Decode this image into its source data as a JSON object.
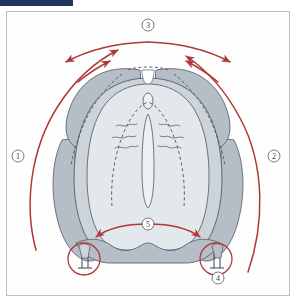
{
  "figure": {
    "title": "",
    "type": "anatomical-diagram",
    "frame": {
      "border_color": "#bdbdbd",
      "background_color": "#fefefe"
    },
    "header_bar": {
      "color": "#23355e",
      "label": ""
    },
    "colors": {
      "arrow_red": "#b03838",
      "outline_gray": "#5d6670",
      "fill_light": "#e3e8ec",
      "fill_mid": "#ccd3d9",
      "fill_dark": "#b5bec6",
      "dashed_line": "#4a535c",
      "frame_border": "#bdbdbd"
    },
    "markers": [
      {
        "id": "marker-1",
        "label": "①",
        "number": "1",
        "x": 18,
        "y": 156,
        "description": "left lateral expansion arc"
      },
      {
        "id": "marker-2",
        "label": "②",
        "number": "2",
        "x": 274,
        "y": 156,
        "description": "right lateral expansion arc"
      },
      {
        "id": "marker-3",
        "label": "③",
        "number": "3",
        "x": 148,
        "y": 25,
        "description": "anterior transverse expansion arc"
      },
      {
        "id": "marker-4",
        "label": "④",
        "number": "4",
        "x": 218,
        "y": 278,
        "description": "posterior tuberosity detail circle"
      },
      {
        "id": "marker-5",
        "label": "⑤",
        "number": "5",
        "x": 148,
        "y": 224,
        "description": "posterior transverse expansion arc"
      }
    ],
    "anatomy_parts": [
      {
        "name": "palatal-vault",
        "fill": "#e3e8ec"
      },
      {
        "name": "alveolar-ridge",
        "fill": "#ccd3d9"
      },
      {
        "name": "left-lateral-lobe",
        "fill": "#b5bec6"
      },
      {
        "name": "right-lateral-lobe",
        "fill": "#b5bec6"
      },
      {
        "name": "left-posterior-lobe",
        "fill": "#b5bec6"
      },
      {
        "name": "right-posterior-lobe",
        "fill": "#b5bec6"
      },
      {
        "name": "incisive-papilla",
        "fill": "#eef1f3"
      },
      {
        "name": "median-raphe",
        "fill": "#eef1f3"
      },
      {
        "name": "palatal-rugae",
        "count": 6
      },
      {
        "name": "midpalatal-suture-dashed",
        "style": "dashed"
      },
      {
        "name": "posterior-border-dashed",
        "style": "dashed"
      }
    ],
    "arrows": {
      "outer_left_arc": "curved arc from lower-left sweeping up over the top-left",
      "outer_right_arc": "curved arc from lower-right sweeping up over the top-right",
      "top_arc": "wide arc spanning the anterior region with arrowheads at both ends",
      "inner_left_arrow": "short arrow pointing up-right at the anterior left",
      "inner_right_arrow": "short arrow pointing up-right at the anterior right",
      "bottom_arc": "arc spanning the posterior region with arrowheads at both ends"
    }
  }
}
